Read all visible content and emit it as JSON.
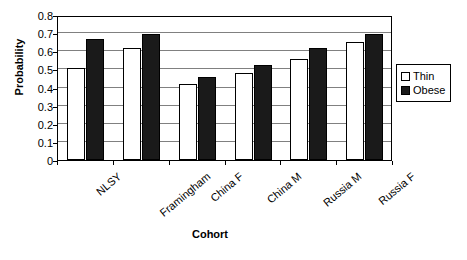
{
  "chart_data": {
    "type": "bar",
    "title": "",
    "xlabel": "Cohort",
    "ylabel": "Probability",
    "ylim": [
      0,
      0.8
    ],
    "yticks": [
      "0",
      "0.1",
      "0.2",
      "0.3",
      "0.4",
      "0.5",
      "0.6",
      "0.7",
      "0.8"
    ],
    "grid": true,
    "legend_position": "right",
    "categories": [
      "NLSY",
      "Framingham",
      "China F",
      "China M",
      "Russia M",
      "Russia F"
    ],
    "series": [
      {
        "name": "Thin",
        "color": "#ffffff",
        "values": [
          0.51,
          0.62,
          0.42,
          0.48,
          0.56,
          0.65
        ]
      },
      {
        "name": "Obese",
        "color": "#1a1a1a",
        "values": [
          0.67,
          0.695,
          0.46,
          0.525,
          0.62,
          0.695
        ]
      }
    ]
  }
}
